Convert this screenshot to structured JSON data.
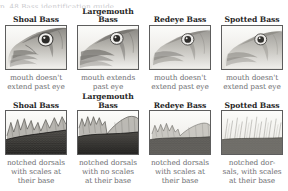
{
  "top_clipped_text": "p. 48    Bass identification guide",
  "figure": {
    "name": "bass-identification-comparison",
    "colors": {
      "title": "#262626",
      "caption": "#6f6f73",
      "border": "#5d5d5d",
      "background": "#ffffff"
    }
  },
  "rows": [
    {
      "id": "head-profiles",
      "feature": "mouth",
      "cells": [
        {
          "title": "Shoal Bass",
          "image": "shoal-bass-head",
          "caption": "mouth doesn't\nextend past eye"
        },
        {
          "title": "Largemouth\nBass",
          "image": "largemouth-bass-head",
          "caption": "mouth extends\npast eye"
        },
        {
          "title": "Redeye Bass",
          "image": "redeye-bass-head",
          "caption": "mouth doesn't\nextend past eye"
        },
        {
          "title": "Spotted Bass",
          "image": "spotted-bass-head",
          "caption": "mouth doesn't\nextend past eye"
        }
      ]
    },
    {
      "id": "dorsal-fins",
      "feature": "dorsal fin",
      "cells": [
        {
          "title": "Shoal Bass",
          "image": "shoal-bass-dorsal",
          "caption": "notched dorsals\nwith scales at\ntheir base"
        },
        {
          "title": "Largemouth\nBass",
          "image": "largemouth-bass-dorsal",
          "caption": "notched dorsals\nwith no scales\nat their base"
        },
        {
          "title": "Redeye Bass",
          "image": "redeye-bass-dorsal",
          "caption": "notched dorsals\nwith scales at\ntheir base"
        },
        {
          "title": "Spotted Bass",
          "image": "spotted-bass-dorsal",
          "caption": "notched dor-\nsals, with scales\nat their base"
        }
      ]
    }
  ]
}
